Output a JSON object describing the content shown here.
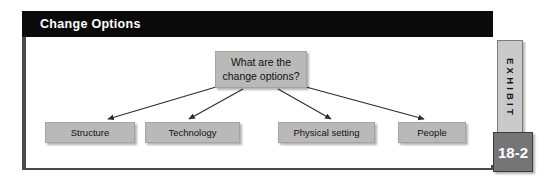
{
  "exhibit": {
    "title": "Change Options",
    "tab_label": "EXHIBIT",
    "number": "18-2",
    "colors": {
      "title_bar_bg": "#0a0a0a",
      "title_bar_text": "#ffffff",
      "frame_border": "#4a4a4a",
      "node_fill": "#b9b9b9",
      "node_border": "#a3a3a3",
      "node_text": "#111111",
      "arrow": "#2b2b2b",
      "tab_strip_fill": "#c9c9c9",
      "tab_number_fill": "#757575",
      "background": "#ffffff"
    }
  },
  "diagram": {
    "type": "hierarchy",
    "root": {
      "id": "center",
      "label": "What are the\nchange options?"
    },
    "children": [
      {
        "id": "structure",
        "label": "Structure"
      },
      {
        "id": "technology",
        "label": "Technology"
      },
      {
        "id": "physical-setting",
        "label": "Physical setting"
      },
      {
        "id": "people",
        "label": "People"
      }
    ],
    "edge_count": 4,
    "edge_style": "straight-arrow-down"
  }
}
